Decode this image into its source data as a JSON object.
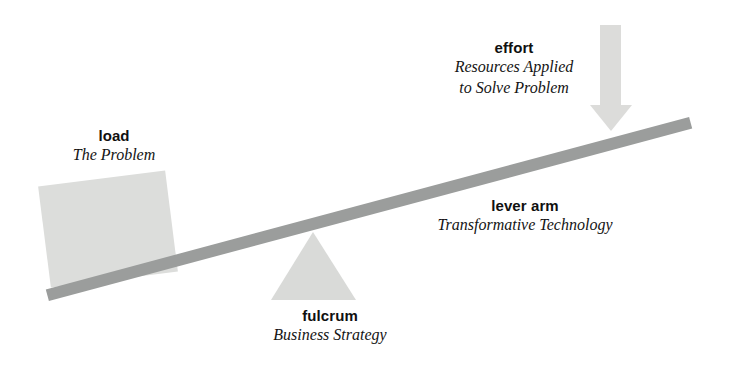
{
  "diagram": {
    "background_color": "#ffffff",
    "colors": {
      "lever_bar": "#9b9d9c",
      "load_block": "#dcdddb",
      "fulcrum_triangle": "#d9dad8",
      "effort_arrow": "#dcdcda",
      "text": "#141414"
    },
    "elements": {
      "load": {
        "term": "load",
        "description_lines": [
          "The Problem"
        ],
        "shape": "square"
      },
      "effort": {
        "term": "effort",
        "description_lines": [
          "Resources Applied",
          "to Solve Problem"
        ],
        "shape": "down-arrow"
      },
      "lever_arm": {
        "term": "lever arm",
        "description_lines": [
          "Transformative Technology"
        ],
        "shape": "tilted-bar"
      },
      "fulcrum": {
        "term": "fulcrum",
        "description_lines": [
          "Business Strategy"
        ],
        "shape": "triangle"
      }
    }
  }
}
